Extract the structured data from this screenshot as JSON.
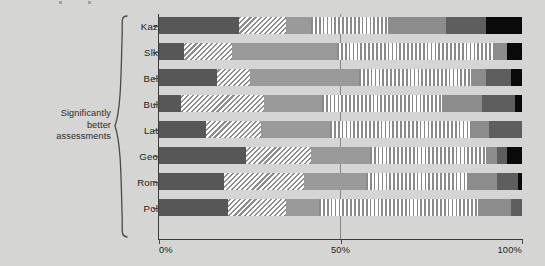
{
  "annotation": {
    "lines": [
      "Significantly",
      "better",
      "assessments"
    ]
  },
  "axis": {
    "x_ticks": [
      "0%",
      "50%",
      "100%"
    ],
    "x_tick_values": [
      0,
      50,
      100
    ],
    "xlim": [
      0,
      100
    ],
    "midline_value": 50
  },
  "colors": {
    "background": "#d5d5d3",
    "dark": "#575757",
    "diagonal_hatch": "#8e8e8e",
    "medium": "#9a9a9a",
    "vertical_hatch": "#8a8a8a",
    "gray": "#8c8c8c",
    "darkgray": "#5e5e5e",
    "black": "#0a0a0a",
    "axis": "#3a3a3a"
  },
  "chart_data": {
    "type": "bar",
    "orientation": "horizontal",
    "stacked": true,
    "stack_mode": "percent",
    "title": "",
    "xlabel": "",
    "ylabel": "",
    "xlim": [
      0,
      100
    ],
    "grid": false,
    "legend_position": "none",
    "categories": [
      "Kaz",
      "Slk",
      "Bel",
      "Bul",
      "Lat",
      "Geo",
      "Rom",
      "Pol"
    ],
    "series": [
      {
        "name": "segment-1",
        "style": "dark",
        "values": [
          22,
          7,
          16,
          6,
          13,
          24,
          18,
          19
        ]
      },
      {
        "name": "segment-2",
        "style": "diagonal",
        "values": [
          13,
          13,
          9,
          23,
          15,
          18,
          22,
          16
        ]
      },
      {
        "name": "segment-3",
        "style": "medium",
        "values": [
          7,
          29,
          30,
          16,
          19,
          16,
          17,
          9
        ]
      },
      {
        "name": "segment-4",
        "style": "vertical",
        "values": [
          21,
          43,
          31,
          33,
          39,
          32,
          28,
          44
        ]
      },
      {
        "name": "segment-5",
        "style": "gray",
        "values": [
          16,
          4,
          4,
          11,
          5,
          3,
          8,
          9
        ]
      },
      {
        "name": "segment-6",
        "style": "darkgray",
        "values": [
          11,
          0,
          7,
          9,
          9,
          3,
          6,
          3
        ]
      },
      {
        "name": "segment-7",
        "style": "black",
        "values": [
          10,
          4,
          3,
          2,
          0,
          4,
          1,
          0
        ]
      }
    ]
  },
  "rows": [
    {
      "label": "Kaz",
      "segments": [
        {
          "style": "dark",
          "value": 22
        },
        {
          "style": "diag",
          "value": 13
        },
        {
          "style": "medium",
          "value": 7
        },
        {
          "style": "vert",
          "value": 21
        },
        {
          "style": "gray",
          "value": 16
        },
        {
          "style": "darkgray",
          "value": 11
        },
        {
          "style": "black",
          "value": 10
        }
      ]
    },
    {
      "label": "Slk",
      "segments": [
        {
          "style": "dark",
          "value": 7
        },
        {
          "style": "diag",
          "value": 13
        },
        {
          "style": "medium",
          "value": 29
        },
        {
          "style": "vert",
          "value": 43
        },
        {
          "style": "gray",
          "value": 4
        },
        {
          "style": "black",
          "value": 4
        }
      ]
    },
    {
      "label": "Bel",
      "segments": [
        {
          "style": "dark",
          "value": 16
        },
        {
          "style": "diag",
          "value": 9
        },
        {
          "style": "medium",
          "value": 30
        },
        {
          "style": "vert",
          "value": 31
        },
        {
          "style": "gray",
          "value": 4
        },
        {
          "style": "darkgray",
          "value": 7
        },
        {
          "style": "black",
          "value": 3
        }
      ]
    },
    {
      "label": "Bul",
      "segments": [
        {
          "style": "dark",
          "value": 6
        },
        {
          "style": "diag",
          "value": 23
        },
        {
          "style": "medium",
          "value": 16
        },
        {
          "style": "vert",
          "value": 33
        },
        {
          "style": "gray",
          "value": 11
        },
        {
          "style": "darkgray",
          "value": 9
        },
        {
          "style": "black",
          "value": 2
        }
      ]
    },
    {
      "label": "Lat",
      "segments": [
        {
          "style": "dark",
          "value": 13
        },
        {
          "style": "diag",
          "value": 15
        },
        {
          "style": "medium",
          "value": 19
        },
        {
          "style": "vert",
          "value": 39
        },
        {
          "style": "gray",
          "value": 5
        },
        {
          "style": "darkgray",
          "value": 9
        }
      ]
    },
    {
      "label": "Geo",
      "segments": [
        {
          "style": "dark",
          "value": 24
        },
        {
          "style": "diag",
          "value": 18
        },
        {
          "style": "medium",
          "value": 16
        },
        {
          "style": "vert",
          "value": 32
        },
        {
          "style": "gray",
          "value": 3
        },
        {
          "style": "darkgray",
          "value": 3
        },
        {
          "style": "black",
          "value": 4
        }
      ]
    },
    {
      "label": "Rom",
      "segments": [
        {
          "style": "dark",
          "value": 18
        },
        {
          "style": "diag",
          "value": 22
        },
        {
          "style": "medium",
          "value": 17
        },
        {
          "style": "vert",
          "value": 28
        },
        {
          "style": "gray",
          "value": 8
        },
        {
          "style": "darkgray",
          "value": 6
        },
        {
          "style": "black",
          "value": 1
        }
      ]
    },
    {
      "label": "Pol",
      "segments": [
        {
          "style": "dark",
          "value": 19
        },
        {
          "style": "diag",
          "value": 16
        },
        {
          "style": "medium",
          "value": 9
        },
        {
          "style": "vert",
          "value": 44
        },
        {
          "style": "gray",
          "value": 9
        },
        {
          "style": "darkgray",
          "value": 3
        }
      ]
    }
  ]
}
